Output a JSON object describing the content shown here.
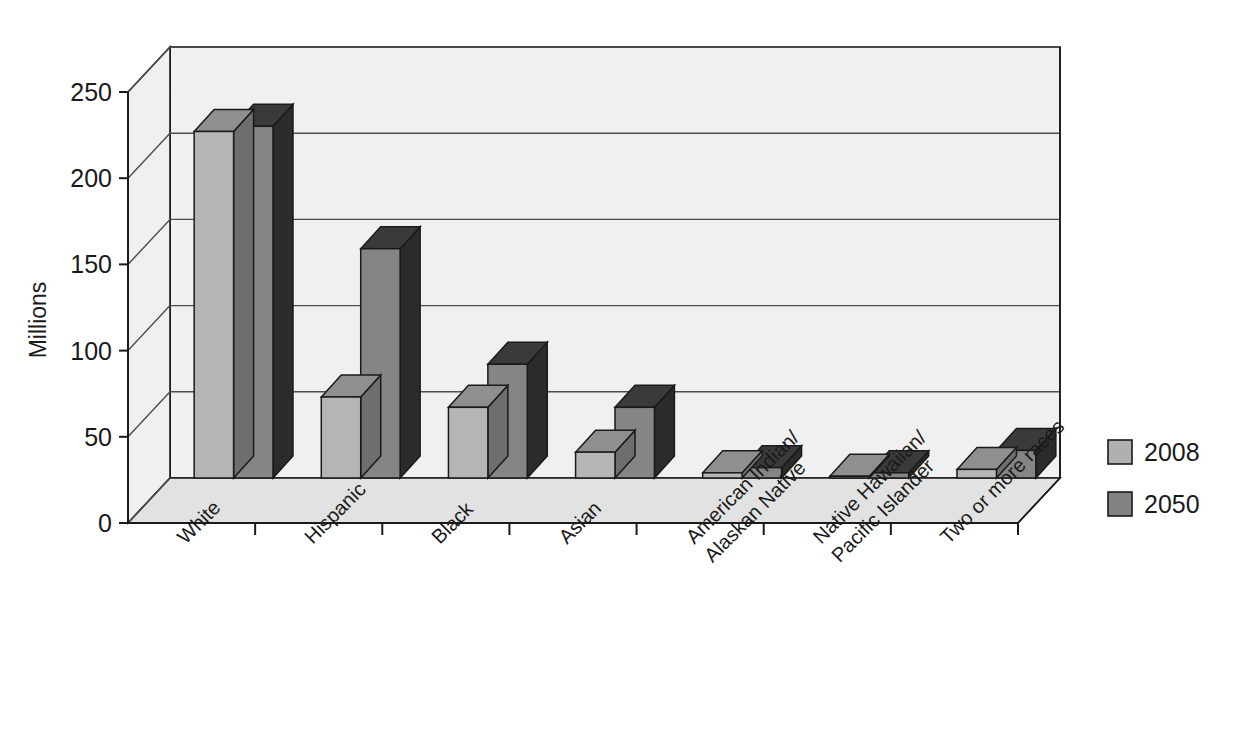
{
  "chart_data": {
    "type": "bar",
    "title": "",
    "xlabel": "",
    "ylabel": "Millions",
    "ylim": [
      0,
      250
    ],
    "ytick_values": [
      0,
      50,
      100,
      150,
      200,
      250
    ],
    "ytick_labels": [
      "0",
      "50",
      "100",
      "150",
      "200",
      "250"
    ],
    "grid": true,
    "three_d": true,
    "legend_position": "right",
    "categories": [
      "White",
      "Hispanic",
      "Black",
      "Asian",
      "American Indian/ Alaskan Native",
      "Native Hawaiian/ Pacific Islander",
      "Two or more races"
    ],
    "category_lines": [
      [
        "White"
      ],
      [
        "Hispanic"
      ],
      [
        "Black"
      ],
      [
        "Asian"
      ],
      [
        "American Indian/",
        "Alaskan Native"
      ],
      [
        "Native Hawaiian/",
        "Pacific Islander"
      ],
      [
        "Two or more races"
      ]
    ],
    "series": [
      {
        "name": "2008",
        "color": "#b0b0b0",
        "values": [
          201,
          47,
          41,
          15,
          3,
          1,
          5
        ]
      },
      {
        "name": "2050",
        "color": "#828282",
        "values": [
          204,
          133,
          66,
          41,
          6,
          3,
          16
        ]
      }
    ]
  },
  "legend": {
    "items": [
      {
        "label": "2008",
        "swatch_color": "#b0b0b0"
      },
      {
        "label": "2050",
        "swatch_color": "#828282"
      }
    ]
  },
  "colors": {
    "series_2008_front": "#b5b5b5",
    "series_2050_front": "#858585",
    "series_2008_side": "#6e6e6e",
    "series_2050_side": "#2b2b2b",
    "series_2008_top": "#8f8f8f",
    "series_2050_top": "#3a3a3a",
    "wall": "#f0f0f0",
    "floor": "#e2e2e2",
    "outline": "#1a1a1a",
    "grid": "#4d4d4d",
    "text": "#1a1a1a"
  }
}
